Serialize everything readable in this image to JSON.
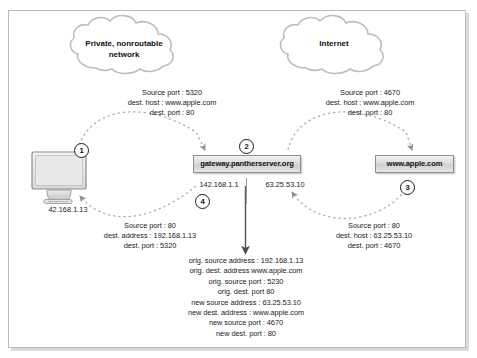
{
  "diagram": {
    "clouds": [
      {
        "id": "private-cloud",
        "label_line1": "Private, nonroutable",
        "label_line2": "network"
      },
      {
        "id": "internet-cloud",
        "label_line1": "Internet",
        "label_line2": ""
      }
    ],
    "nodes": [
      {
        "id": "client",
        "type": "computer",
        "ip": "42.168.1.13",
        "callout": "1"
      },
      {
        "id": "gateway",
        "type": "box",
        "label": "gateway.pantherserver.org",
        "callout": "2"
      },
      {
        "id": "server",
        "type": "box",
        "label": "www.apple.com",
        "callout": "3"
      }
    ],
    "gateway_interfaces": {
      "inside_ip": "142.168.1.1",
      "outside_ip": "63.25.53.10",
      "inside_callout": "4"
    },
    "packets": {
      "outbound_private": {
        "lines": [
          "Source port : 5320",
          "dest. host : www.apple.com",
          "dest. port : 80"
        ]
      },
      "outbound_public": {
        "lines": [
          "Source port : 4670",
          "dest. host : www.apple.com",
          "dest. port : 80"
        ]
      },
      "inbound_private": {
        "lines": [
          "Source port : 80",
          "dest. address : 192.168.1.13",
          "dest. port : 5320"
        ]
      },
      "inbound_public": {
        "lines": [
          "Source port : 80",
          "dest. host : 63.25.53.10",
          "dest. port : 4670"
        ]
      }
    },
    "translation_table": {
      "lines": [
        "orig. source address : 192.168.1.13",
        "orig. dest. address www.apple.com",
        "orig. source port : 5230",
        "orig. dest. port 80",
        "new source address : 63.25.53.10",
        "new dest. address : www.apple.com",
        "new source port : 4670",
        "new dest. port : 80"
      ]
    },
    "colors": {
      "frame_border": "#b9b9b9",
      "cloud_stroke": "#b5b5b5",
      "arrow_stroke": "#9a9a9a",
      "box_border": "#8e8e8e",
      "text": "#1a1a1a"
    }
  }
}
